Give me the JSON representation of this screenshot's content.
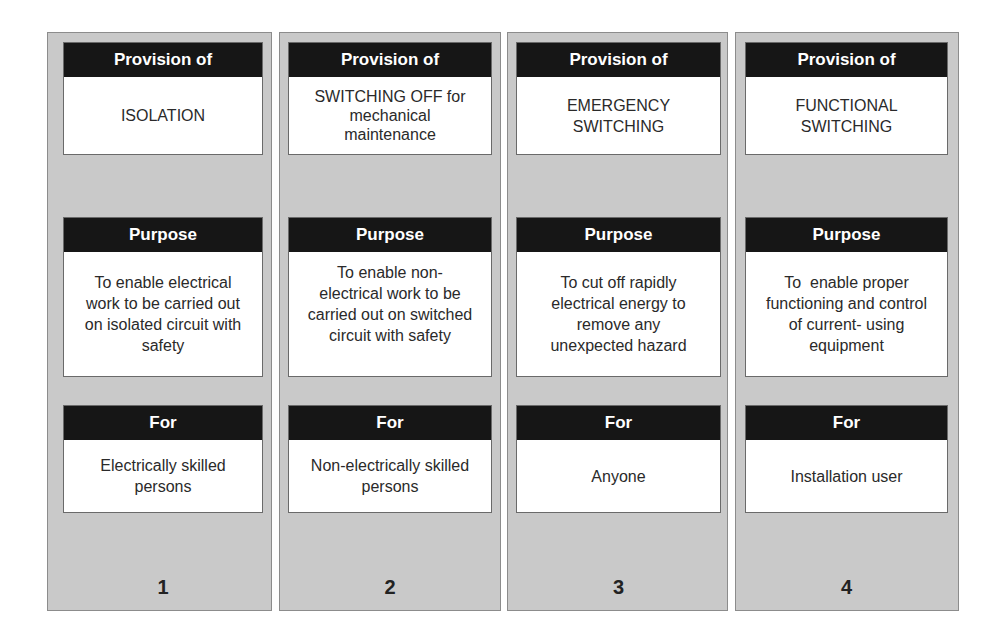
{
  "diagram": {
    "columns": [
      {
        "provision_label": "Provision of",
        "provision_value": "ISOLATION",
        "purpose_label": "Purpose",
        "purpose_value": "To enable electrical\nwork to be carried out\non isolated circuit with\nsafety",
        "for_label": "For",
        "for_value": "Electrically skilled\npersons",
        "number": "1"
      },
      {
        "provision_label": "Provision of",
        "provision_value": "SWITCHING OFF for\nmechanical\nmaintenance",
        "purpose_label": "Purpose",
        "purpose_value": "To enable non-\nelectrical work to be\ncarried out on switched\ncircuit with safety",
        "for_label": "For",
        "for_value": "Non-electrically skilled\npersons",
        "number": "2"
      },
      {
        "provision_label": "Provision of",
        "provision_value": "EMERGENCY\nSWITCHING",
        "purpose_label": "Purpose",
        "purpose_value": "To cut off rapidly\nelectrical energy to\nremove any\nunexpected hazard",
        "for_label": "For",
        "for_value": "Anyone",
        "number": "3"
      },
      {
        "provision_label": "Provision of",
        "provision_value": "FUNCTIONAL\nSWITCHING",
        "purpose_label": "Purpose",
        "purpose_value": "To  enable proper\nfunctioning and control\nof current- using\nequipment",
        "for_label": "For",
        "for_value": "Installation user",
        "number": "4"
      }
    ],
    "colors": {
      "column_bg": "#c9c9c9",
      "header_bg": "#161616",
      "header_text": "#ffffff",
      "card_bg": "#ffffff"
    }
  }
}
